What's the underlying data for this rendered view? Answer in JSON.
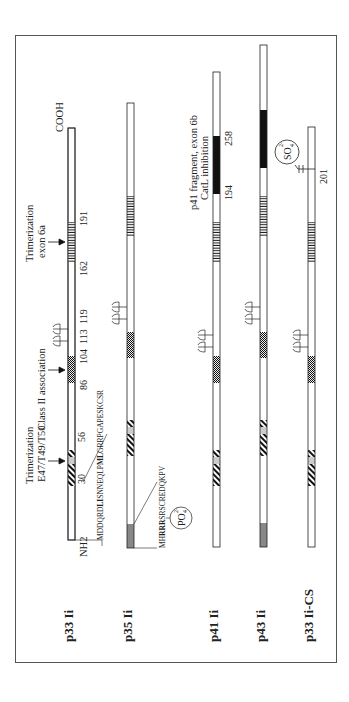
{
  "figure": {
    "orientation": "rotated-90-ccw",
    "termini": {
      "n": "NH2",
      "c": "COOH"
    },
    "isoforms": [
      {
        "label": "p33 Ii"
      },
      {
        "label": "p35 Ii"
      },
      {
        "label": "p41 Ii"
      },
      {
        "label": "p43 Ii"
      },
      {
        "label": "p33 Ii-CS"
      }
    ],
    "annotations": {
      "trimer1_line1": "Trimerization",
      "trimer1_line2": "E47/T49/T50",
      "classii": "Class II association",
      "trimer2_line1": "Trimerization",
      "trimer2_line2": "exon 6a",
      "p41_line1": "p41 fragment, exon 6b",
      "p41_line2": "CatL inhibition",
      "seq_p33_a": "MDDQRD",
      "seq_p33_b": "LI",
      "seq_p33_c": "SNNEQLP",
      "seq_p33_d": "ML",
      "seq_p33_e": "GRRPGAPESKCSR",
      "seq_p35_a": "MH",
      "seq_p35_b": "RRR",
      "seq_p35_c": "SRSCREDQKPV",
      "po4": "PO",
      "po4_sup": "2-",
      "po4_sub": "4",
      "so4": "SO",
      "so4_sup": "2-",
      "so4_sub": "4"
    },
    "positions": {
      "p30": "30",
      "p56": "56",
      "p86": "86",
      "p104": "104",
      "p113": "113",
      "p119": "119",
      "p162": "162",
      "p191": "191",
      "p194": "194",
      "p258": "258",
      "p201": "201"
    }
  }
}
